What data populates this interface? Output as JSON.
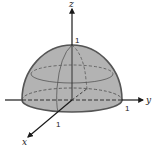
{
  "figure": {
    "axes": {
      "z": {
        "label": "z",
        "tick_label": "1"
      },
      "y": {
        "label": "y",
        "tick_label": "1"
      },
      "x": {
        "label": "x",
        "tick_label": "1"
      }
    },
    "colors": {
      "fill": "#b3b3b3",
      "outline": "#555555",
      "axis": "#1a1a1a",
      "background": "#ffffff"
    }
  }
}
